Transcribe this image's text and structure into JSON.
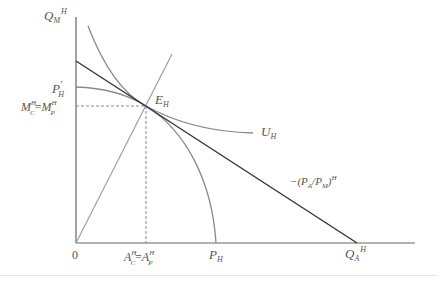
{
  "diagram": {
    "type": "production-consumption equilibrium (economics)",
    "colors": {
      "axis": "#666666",
      "budget_line": "#333333",
      "curves": "#8a8a8a",
      "dashed": "#8a8a8a",
      "text": "#555555"
    },
    "labels": {
      "y_axis_base": "Q",
      "y_axis_sub": "M",
      "y_axis_sup": "H",
      "origin": "0",
      "p_prime_base": "P",
      "p_prime_mark": "′",
      "p_prime_sub": "H",
      "mc_left_base": "M",
      "mc_left_sup": "H",
      "mc_left_sub": "C",
      "mc_eq": "=",
      "mc_right_base": "M",
      "mc_right_sup": "H",
      "mc_right_sub": "P",
      "e_base": "E",
      "e_sub": "H",
      "u_base": "U",
      "u_sub": "H",
      "price_prefix": "−(P",
      "price_sub_a": "A",
      "price_mid": "/P",
      "price_sub_m": "M",
      "price_close": ")",
      "price_sup": "H",
      "ac_left_base": "A",
      "ac_left_sup": "H",
      "ac_left_sub": "C",
      "ac_eq": "=",
      "ac_right_base": "A",
      "ac_right_sup": "H",
      "ac_right_sub": "P",
      "ph_base": "P",
      "ph_sub": "H",
      "qa_base": "Q",
      "qa_sub": "A",
      "qa_sup": "H"
    },
    "elements": [
      "vertical axis (Q_M^H)",
      "horizontal axis (Q_A^H)",
      "production possibility frontier from P'_H to P_H",
      "indifference curve U_H",
      "price line −(P_A/P_M)^H tangent at E_H",
      "ray from origin through E_H",
      "dashed guides to M_C^H = M_P^H and A_C^H = A_P^H"
    ]
  }
}
